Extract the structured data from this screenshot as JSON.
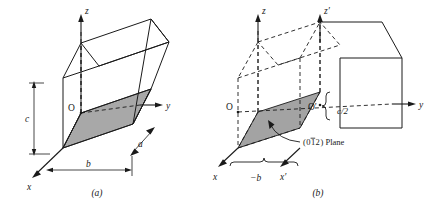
{
  "figure": {
    "background_color": "#ffffff",
    "line_color": "#1a1a1a",
    "plane_fill_color": "#a8a8a8",
    "plane_fill_color_b": "#a3a3a3"
  },
  "panel_a": {
    "caption": "(a)",
    "axes": {
      "z": "z",
      "y": "y",
      "x": "x"
    },
    "origin": "O",
    "dimensions": {
      "c": "c",
      "b": "b",
      "a": "a"
    }
  },
  "panel_b": {
    "caption": "(b)",
    "axes": {
      "z": "z",
      "z_prime": "z′",
      "y": "y",
      "x": "x",
      "x_prime": "x′"
    },
    "origin": "O",
    "origin_prime": "O′",
    "dimensions": {
      "c_half": "c/2",
      "minus_b": "−b"
    },
    "plane_label": {
      "indices": "(01̅2) Plane",
      "index_h": "0",
      "index_k": "1",
      "index_k_bar": true,
      "index_l": "2",
      "suffix": "Plane"
    }
  }
}
